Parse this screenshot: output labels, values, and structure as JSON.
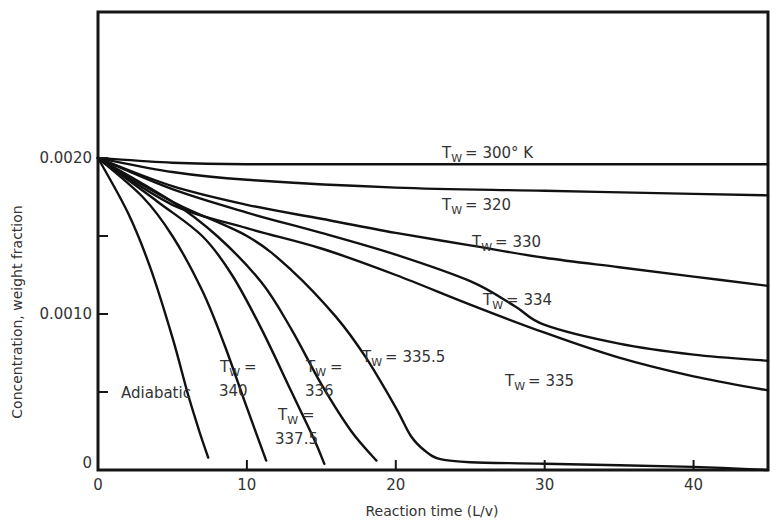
{
  "chart_data": {
    "type": "line",
    "title": "",
    "xlabel": "Reaction time (L/v)",
    "ylabel": "Concentration, weight fraction",
    "xlim": [
      0,
      45
    ],
    "ylim": [
      0,
      0.0029
    ],
    "x_ticks": [
      {
        "value": 0,
        "label": "0"
      },
      {
        "value": 10,
        "label": "10"
      },
      {
        "value": 20,
        "label": "20"
      },
      {
        "value": 30,
        "label": "30"
      },
      {
        "value": 40,
        "label": "40"
      }
    ],
    "y_ticks": [
      {
        "value": 0,
        "label": "0"
      },
      {
        "value": 0.0005,
        "label": ""
      },
      {
        "value": 0.001,
        "label": "0.0010"
      },
      {
        "value": 0.0015,
        "label": ""
      },
      {
        "value": 0.002,
        "label": "0.0020"
      }
    ],
    "grid": false,
    "legend": "inline annotations",
    "series": [
      {
        "name": "Tw = 300° K",
        "label_main": "T",
        "label_sub": "W",
        "label_rest": "= 300° K",
        "x": [
          0,
          5,
          10,
          20,
          30,
          40,
          45
        ],
        "y": [
          0.002,
          0.00197,
          0.00196,
          0.00196,
          0.00196,
          0.00196,
          0.00196
        ]
      },
      {
        "name": "Tw = 320",
        "label_main": "T",
        "label_sub": "W",
        "label_rest": "= 320",
        "x": [
          0,
          5,
          10,
          20,
          30,
          40,
          45
        ],
        "y": [
          0.002,
          0.00191,
          0.00186,
          0.00181,
          0.00179,
          0.00177,
          0.00176
        ]
      },
      {
        "name": "Tw = 330",
        "label_main": "T",
        "label_sub": "W",
        "label_rest": "= 330",
        "x": [
          0,
          5,
          10,
          15,
          20,
          25,
          30,
          35,
          40,
          45
        ],
        "y": [
          0.002,
          0.00182,
          0.0017,
          0.00161,
          0.00152,
          0.00144,
          0.00136,
          0.0013,
          0.00124,
          0.00118
        ]
      },
      {
        "name": "Tw = 334",
        "label_main": "T",
        "label_sub": "W",
        "label_rest": "= 334",
        "x": [
          0,
          5,
          10,
          15,
          20,
          25,
          28,
          30,
          35,
          40,
          45
        ],
        "y": [
          0.002,
          0.0018,
          0.00165,
          0.00152,
          0.00138,
          0.00121,
          0.00105,
          0.00093,
          0.00081,
          0.00074,
          0.0007
        ]
      },
      {
        "name": "Tw = 335",
        "label_main": "T",
        "label_sub": "W",
        "label_rest": "= 335",
        "x": [
          0,
          5,
          10,
          15,
          20,
          25,
          30,
          35,
          40,
          45
        ],
        "y": [
          0.002,
          0.0017,
          0.00155,
          0.00142,
          0.00125,
          0.00106,
          0.00088,
          0.00072,
          0.0006,
          0.00051
        ]
      },
      {
        "name": "Tw = 335.5",
        "label_main": "T",
        "label_sub": "W",
        "label_rest": "= 335.5",
        "x": [
          0,
          5,
          10,
          13,
          16,
          18,
          20,
          21,
          22,
          23,
          25,
          30,
          40,
          45
        ],
        "y": [
          0.002,
          0.00172,
          0.0015,
          0.00128,
          0.00098,
          0.00072,
          0.0004,
          0.00022,
          0.00012,
          7e-05,
          5e-05,
          4e-05,
          2e-05,
          0.0
        ]
      },
      {
        "name": "Tw = 336",
        "label_main": "T",
        "label_sub": "W",
        "label_rest": "= 336",
        "x": [
          0,
          5,
          8,
          11,
          13,
          15,
          17,
          18.7
        ],
        "y": [
          0.002,
          0.00172,
          0.0015,
          0.0012,
          0.0009,
          0.00055,
          0.00025,
          6e-05
        ]
      },
      {
        "name": "Tw = 337.5",
        "label_main": "T",
        "label_sub": "W",
        "label_rest": "= 337.5",
        "x": [
          0,
          4,
          7,
          9,
          11,
          13,
          14.5,
          15.2
        ],
        "y": [
          0.002,
          0.00172,
          0.0015,
          0.00125,
          0.0009,
          0.0005,
          0.0002,
          4e-05
        ]
      },
      {
        "name": "Tw = 340",
        "label_main": "T",
        "label_sub": "W",
        "label_rest": "= 340",
        "x": [
          0,
          3,
          5,
          7,
          8.5,
          10,
          11.3
        ],
        "y": [
          0.002,
          0.00175,
          0.0015,
          0.00115,
          0.0008,
          0.0004,
          6e-05
        ]
      },
      {
        "name": "Adiabatic",
        "label_main": "Adiabatic",
        "label_sub": "",
        "label_rest": "",
        "x": [
          0,
          2,
          3.5,
          5,
          6,
          6.8,
          7.4
        ],
        "y": [
          0.002,
          0.00165,
          0.0013,
          0.00085,
          0.0005,
          0.00025,
          8e-05
        ]
      }
    ]
  }
}
